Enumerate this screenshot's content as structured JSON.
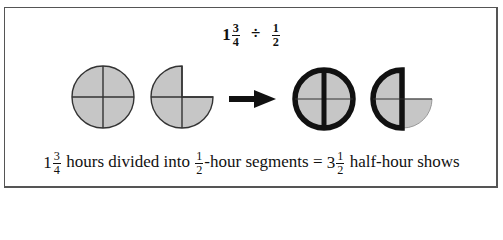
{
  "title": {
    "whole": "1",
    "numerator": "3",
    "denominator": "4",
    "operator": "÷",
    "divisor_numerator": "1",
    "divisor_denominator": "2"
  },
  "caption": {
    "whole": "1",
    "numerator": "3",
    "denominator": "4",
    "text1": "hours divided into",
    "seg_numerator": "1",
    "seg_denominator": "2",
    "text2": "-hour segments =",
    "result_whole": "3",
    "result_numerator": "1",
    "result_denominator": "2",
    "text3": "half-hour shows"
  },
  "figure": {
    "fill_color": "#c6c6c6",
    "thin_stroke": "#333333",
    "thick_stroke": "#111111",
    "shapes": [
      {
        "name": "full-circle",
        "quarters": 4,
        "style": "thin"
      },
      {
        "name": "three-quarter-circle",
        "quarters": 3,
        "style": "thin"
      },
      {
        "name": "arrow",
        "direction": "right"
      },
      {
        "name": "full-circle-halves",
        "quarters": 4,
        "style": "thick-halves"
      },
      {
        "name": "half-plus-quarter",
        "quarters": 3,
        "style": "thick-half-thin-quarter"
      }
    ]
  }
}
